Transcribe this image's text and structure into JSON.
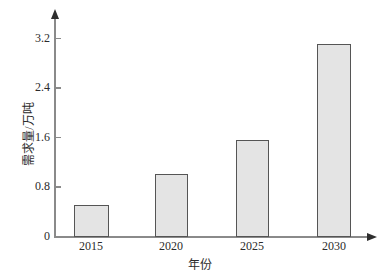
{
  "chart_data": {
    "type": "bar",
    "title": "",
    "subtitle": "",
    "xlabel": "年份",
    "ylabel": "需求量/万吨",
    "categories": [
      "2015",
      "2020",
      "2025",
      "2030"
    ],
    "values": [
      0.5,
      1.0,
      1.55,
      3.1
    ],
    "series": [
      {
        "name": "需求量",
        "values": [
          0.5,
          1.0,
          1.55,
          3.1
        ]
      }
    ],
    "ylim": [
      0,
      3.6
    ],
    "yticks": [
      0,
      0.8,
      1.6,
      2.4,
      3.2
    ],
    "ytick_labels": [
      "0",
      "0.8",
      "1.6",
      "2.4",
      "3.2"
    ],
    "xtick_labels": [
      "2015",
      "2020",
      "2025",
      "2030"
    ],
    "grid": false,
    "legend": false,
    "legend_position": "none",
    "annotations": [],
    "colors": {
      "bar_fill": "#e4e4e4",
      "bar_stroke": "#555555",
      "axis": "#8a8a8a",
      "arrow": "#2e2e2e",
      "text": "#2b2b2b",
      "background": "#ffffff"
    }
  },
  "axes": {
    "y_ticks": [
      {
        "label": "3.2",
        "value": 3.2
      },
      {
        "label": "2.4",
        "value": 2.4
      },
      {
        "label": "1.6",
        "value": 1.6
      },
      {
        "label": "0.8",
        "value": 0.8
      },
      {
        "label": "0",
        "value": 0
      }
    ],
    "x_ticks": [
      {
        "label": "2015"
      },
      {
        "label": "2020"
      },
      {
        "label": "2025"
      },
      {
        "label": "2030"
      }
    ],
    "x_title": "年份",
    "y_title": "需求量/万吨"
  }
}
